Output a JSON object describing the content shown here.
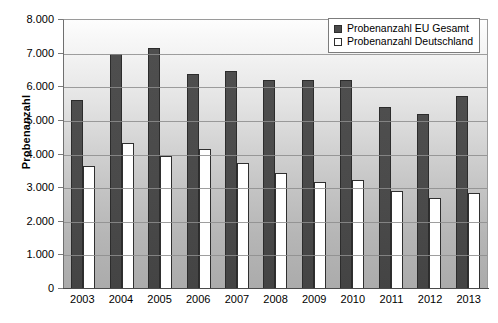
{
  "chart_data": {
    "type": "bar",
    "title": "",
    "xlabel": "",
    "ylabel": "Probenanzahl",
    "ylim": [
      0,
      8000
    ],
    "ytick_step": 1000,
    "grid": true,
    "legend_position": "top-right",
    "categories": [
      "2003",
      "2004",
      "2005",
      "2006",
      "2007",
      "2008",
      "2009",
      "2010",
      "2011",
      "2012",
      "2013"
    ],
    "ytick_labels": [
      "8.000",
      "7.000",
      "6.000",
      "5.000",
      "4.000",
      "3.000",
      "2.000",
      "1.000",
      "0"
    ],
    "ytick_values": [
      8000,
      7000,
      6000,
      5000,
      4000,
      3000,
      2000,
      1000,
      0
    ],
    "series": [
      {
        "name": "Probenanzahl EU Gesamt",
        "color": "#4a4a4a",
        "values": [
          5600,
          6950,
          7130,
          6370,
          6450,
          6200,
          6200,
          6200,
          5380,
          5180,
          5700
        ]
      },
      {
        "name": "Probenanzahl Deutschland",
        "color": "#ffffff",
        "values": [
          3620,
          4300,
          3940,
          4120,
          3730,
          3410,
          3150,
          3220,
          2900,
          2670,
          2830
        ]
      }
    ]
  },
  "legend": {
    "items": [
      {
        "label": "Probenanzahl EU Gesamt"
      },
      {
        "label": "Probenanzahl Deutschland"
      }
    ]
  },
  "axis": {
    "y_title": "Probenanzahl"
  }
}
